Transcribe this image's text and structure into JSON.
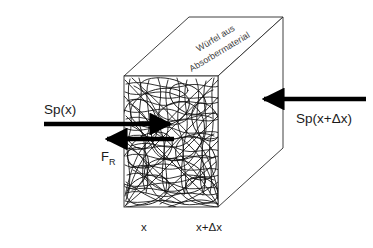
{
  "figure": {
    "type": "physics-schematic",
    "background_color": "#ffffff",
    "line_color": "#1a1a1a",
    "arrow_color": "#000000",
    "text_color": "#1a1a1a"
  },
  "labels": {
    "flux_in_left": "Sp(x)",
    "flux_in_right": "Sp(x+Δx)",
    "friction_force": "F",
    "friction_force_subscript": "R",
    "cube_caption_line1": "Würfel aus",
    "cube_caption_line2": "Absorbermaterial",
    "axis_left": "x",
    "axis_right": "x+Δx"
  },
  "geometry": {
    "front_face": {
      "left": 124,
      "top": 76,
      "right": 218,
      "bottom": 207
    },
    "depth_offset_x": 65,
    "depth_offset_y": -59,
    "fiber_count": 120
  },
  "arrows": {
    "incident_left": {
      "name": "Sp(x)",
      "direction": "right",
      "x_start": 44,
      "x_end": 172,
      "y": 124
    },
    "incident_right": {
      "name": "Sp(x+Δx)",
      "direction": "left",
      "x_start": 365,
      "x_end": 262,
      "y": 99
    },
    "friction": {
      "name": "F_R",
      "direction": "left",
      "x_start": 172,
      "x_end": 105,
      "y": 139
    }
  }
}
